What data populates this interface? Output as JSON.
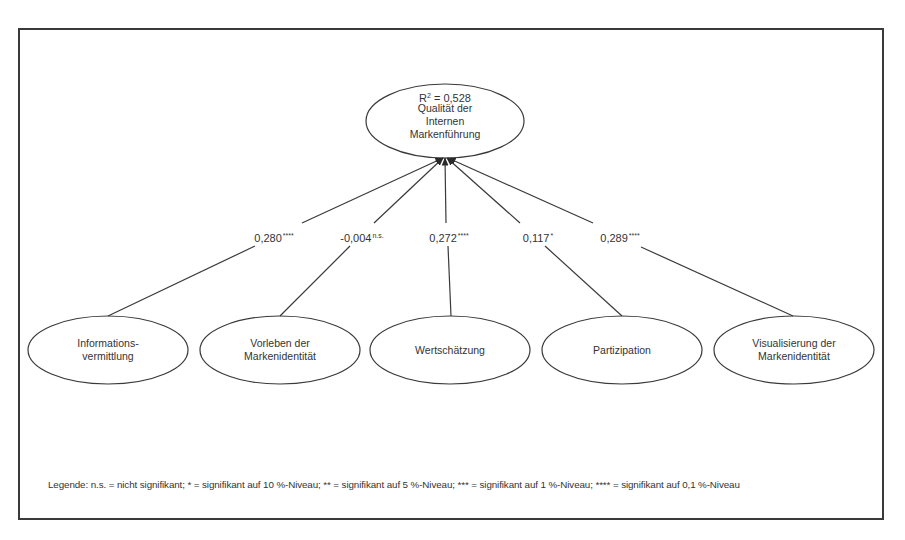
{
  "target": {
    "label": "Qualität der\nInternen\nMarkenführung",
    "r_squared_prefix": "R",
    "r_squared_sup": "2",
    "r_squared_value": " = 0,528"
  },
  "predictors": [
    {
      "label": "Informations-\nvermittlung",
      "coef": "0,280",
      "sig": "****"
    },
    {
      "label": "Vorleben der\nMarkenidentität",
      "coef": "-0,004",
      "sig": "n.s."
    },
    {
      "label": "Wertschätzung",
      "coef": "0,272",
      "sig": "****"
    },
    {
      "label": "Partizipation",
      "coef": "0,117",
      "sig": "*"
    },
    {
      "label": "Visualisierung der\nMarkenidentität",
      "coef": "0,289",
      "sig": "****"
    }
  ],
  "legend": "Legende: n.s. = nicht signifikant; * = signifikant auf 10 %-Niveau; ** = signifikant auf 5 %-Niveau; *** = signifikant auf 1 %-Niveau; **** = signifikant auf 0,1 %-Niveau",
  "colors": {
    "line": "#3a3a3a",
    "text": "#333333",
    "background": "#ffffff"
  }
}
